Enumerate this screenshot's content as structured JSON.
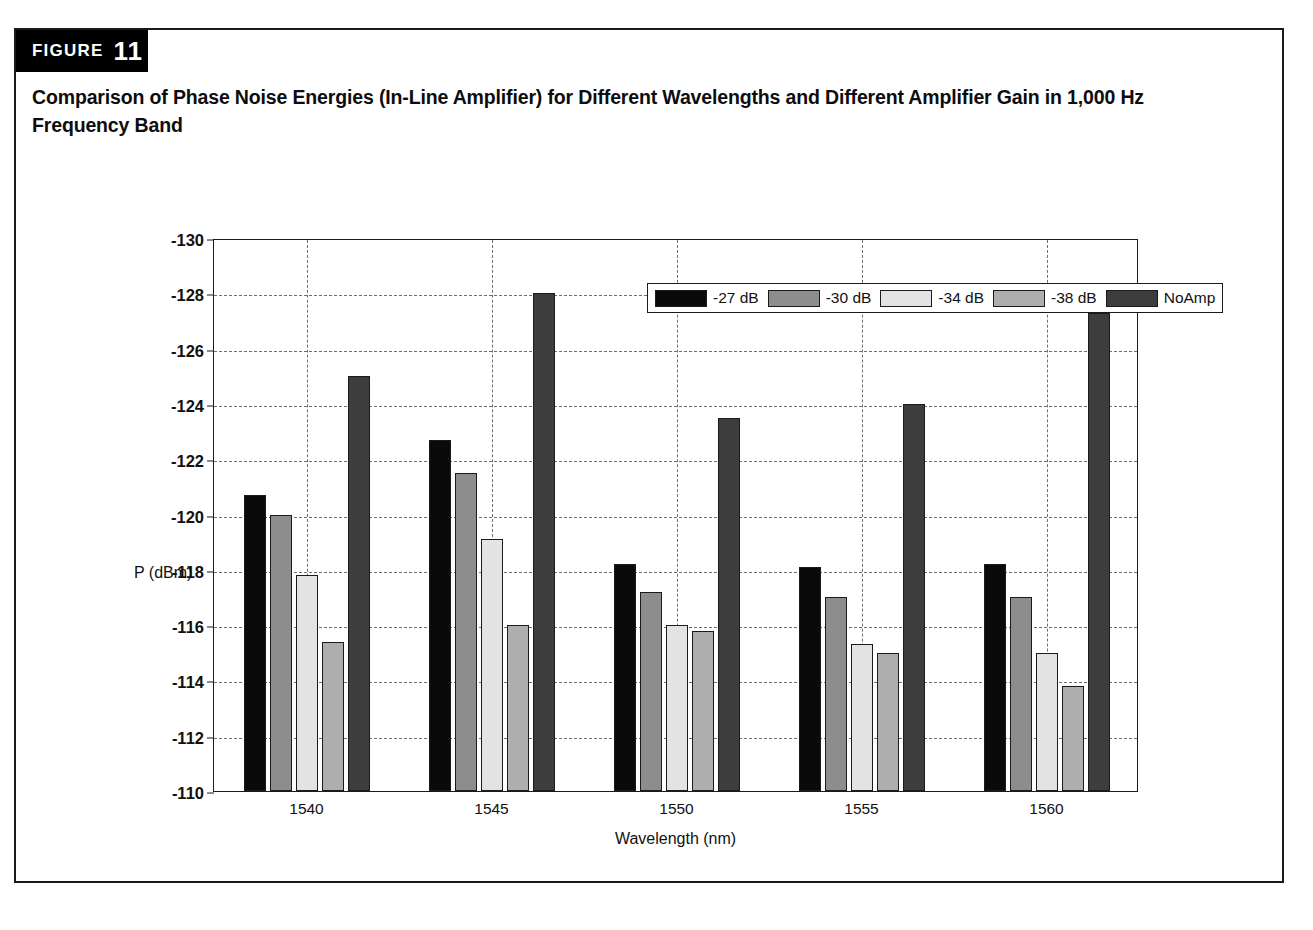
{
  "figure": {
    "label_word": "FIGURE",
    "number": "11",
    "caption": "Comparison of Phase Noise Energies (In-Line Amplifier) for Different Wavelengths and Different Amplifier Gain in 1,000 Hz Frequency Band"
  },
  "colors": {
    "series_27": "#0a0a0a",
    "series_30": "#8d8d8d",
    "series_34": "#e3e3e3",
    "series_38": "#aeaeae",
    "series_noamp": "#3d3d3d",
    "axis": "#1b1b1b",
    "grid": "#6f6f6f",
    "banner_bg": "#000000",
    "banner_text": "#ffffff",
    "frame": "#1a1a1a"
  },
  "chart_data": {
    "type": "bar",
    "title": "Comparison of Phase Noise Energies (In-Line Amplifier) for Different Wavelengths and Different Amplifier Gain in 1,000 Hz Frequency Band",
    "xlabel": "Wavelength (nm)",
    "ylabel": "P (dBm)",
    "categories": [
      "1540",
      "1545",
      "1550",
      "1555",
      "1560"
    ],
    "ylim": [
      -110,
      -130
    ],
    "y_inverted": true,
    "yticks": [
      "-130",
      "-128",
      "-126",
      "-124",
      "-122",
      "-120",
      "-118",
      "-116",
      "-114",
      "-112",
      "-110"
    ],
    "ytick_values": [
      -130,
      -128,
      -126,
      -124,
      -122,
      -120,
      -118,
      -116,
      -114,
      -112,
      -110
    ],
    "grid": true,
    "legend_position": "top-right inside",
    "series": [
      {
        "name": "-27 dB",
        "color": "#0a0a0a",
        "values": [
          -120.7,
          -122.7,
          -118.2,
          -118.1,
          -118.2
        ]
      },
      {
        "name": "-30 dB",
        "color": "#8d8d8d",
        "values": [
          -120.0,
          -121.5,
          -117.2,
          -117.0,
          -117.0
        ]
      },
      {
        "name": "-34 dB",
        "color": "#e3e3e3",
        "values": [
          -117.8,
          -119.1,
          -116.0,
          -115.3,
          -115.0
        ]
      },
      {
        "name": "-38 dB",
        "color": "#aeaeae",
        "values": [
          -115.4,
          -116.0,
          -115.8,
          -115.0,
          -113.8
        ]
      },
      {
        "name": "NoAmp",
        "color": "#3d3d3d",
        "values": [
          -125.0,
          -128.0,
          -123.5,
          -124.0,
          -127.3
        ]
      }
    ]
  }
}
